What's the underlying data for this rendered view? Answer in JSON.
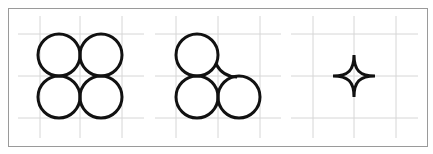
{
  "figure": {
    "title": "",
    "colors": {
      "border": "#9a9a9a",
      "grid": "#d6d6d6",
      "shape_stroke": "#111111",
      "background": "#ffffff"
    },
    "panels": [
      {
        "name": "four-circles",
        "description": "2x2 grid of tangent circles",
        "circles": [
          {
            "col": 0,
            "row": 0
          },
          {
            "col": 1,
            "row": 0
          },
          {
            "col": 0,
            "row": 1
          },
          {
            "col": 1,
            "row": 1
          }
        ]
      },
      {
        "name": "three-circles-with-fillet",
        "description": "three tangent circles in an L arrangement with a concave fillet joining top and bottom-right circles",
        "circles": [
          {
            "col": 0,
            "row": 0
          },
          {
            "col": 0,
            "row": 1
          },
          {
            "col": 1,
            "row": 1
          }
        ],
        "fillet": true
      },
      {
        "name": "astroid-star",
        "description": "four-pointed concave star (astroid-like) centered on grid intersection",
        "shape": "astroid"
      }
    ]
  }
}
